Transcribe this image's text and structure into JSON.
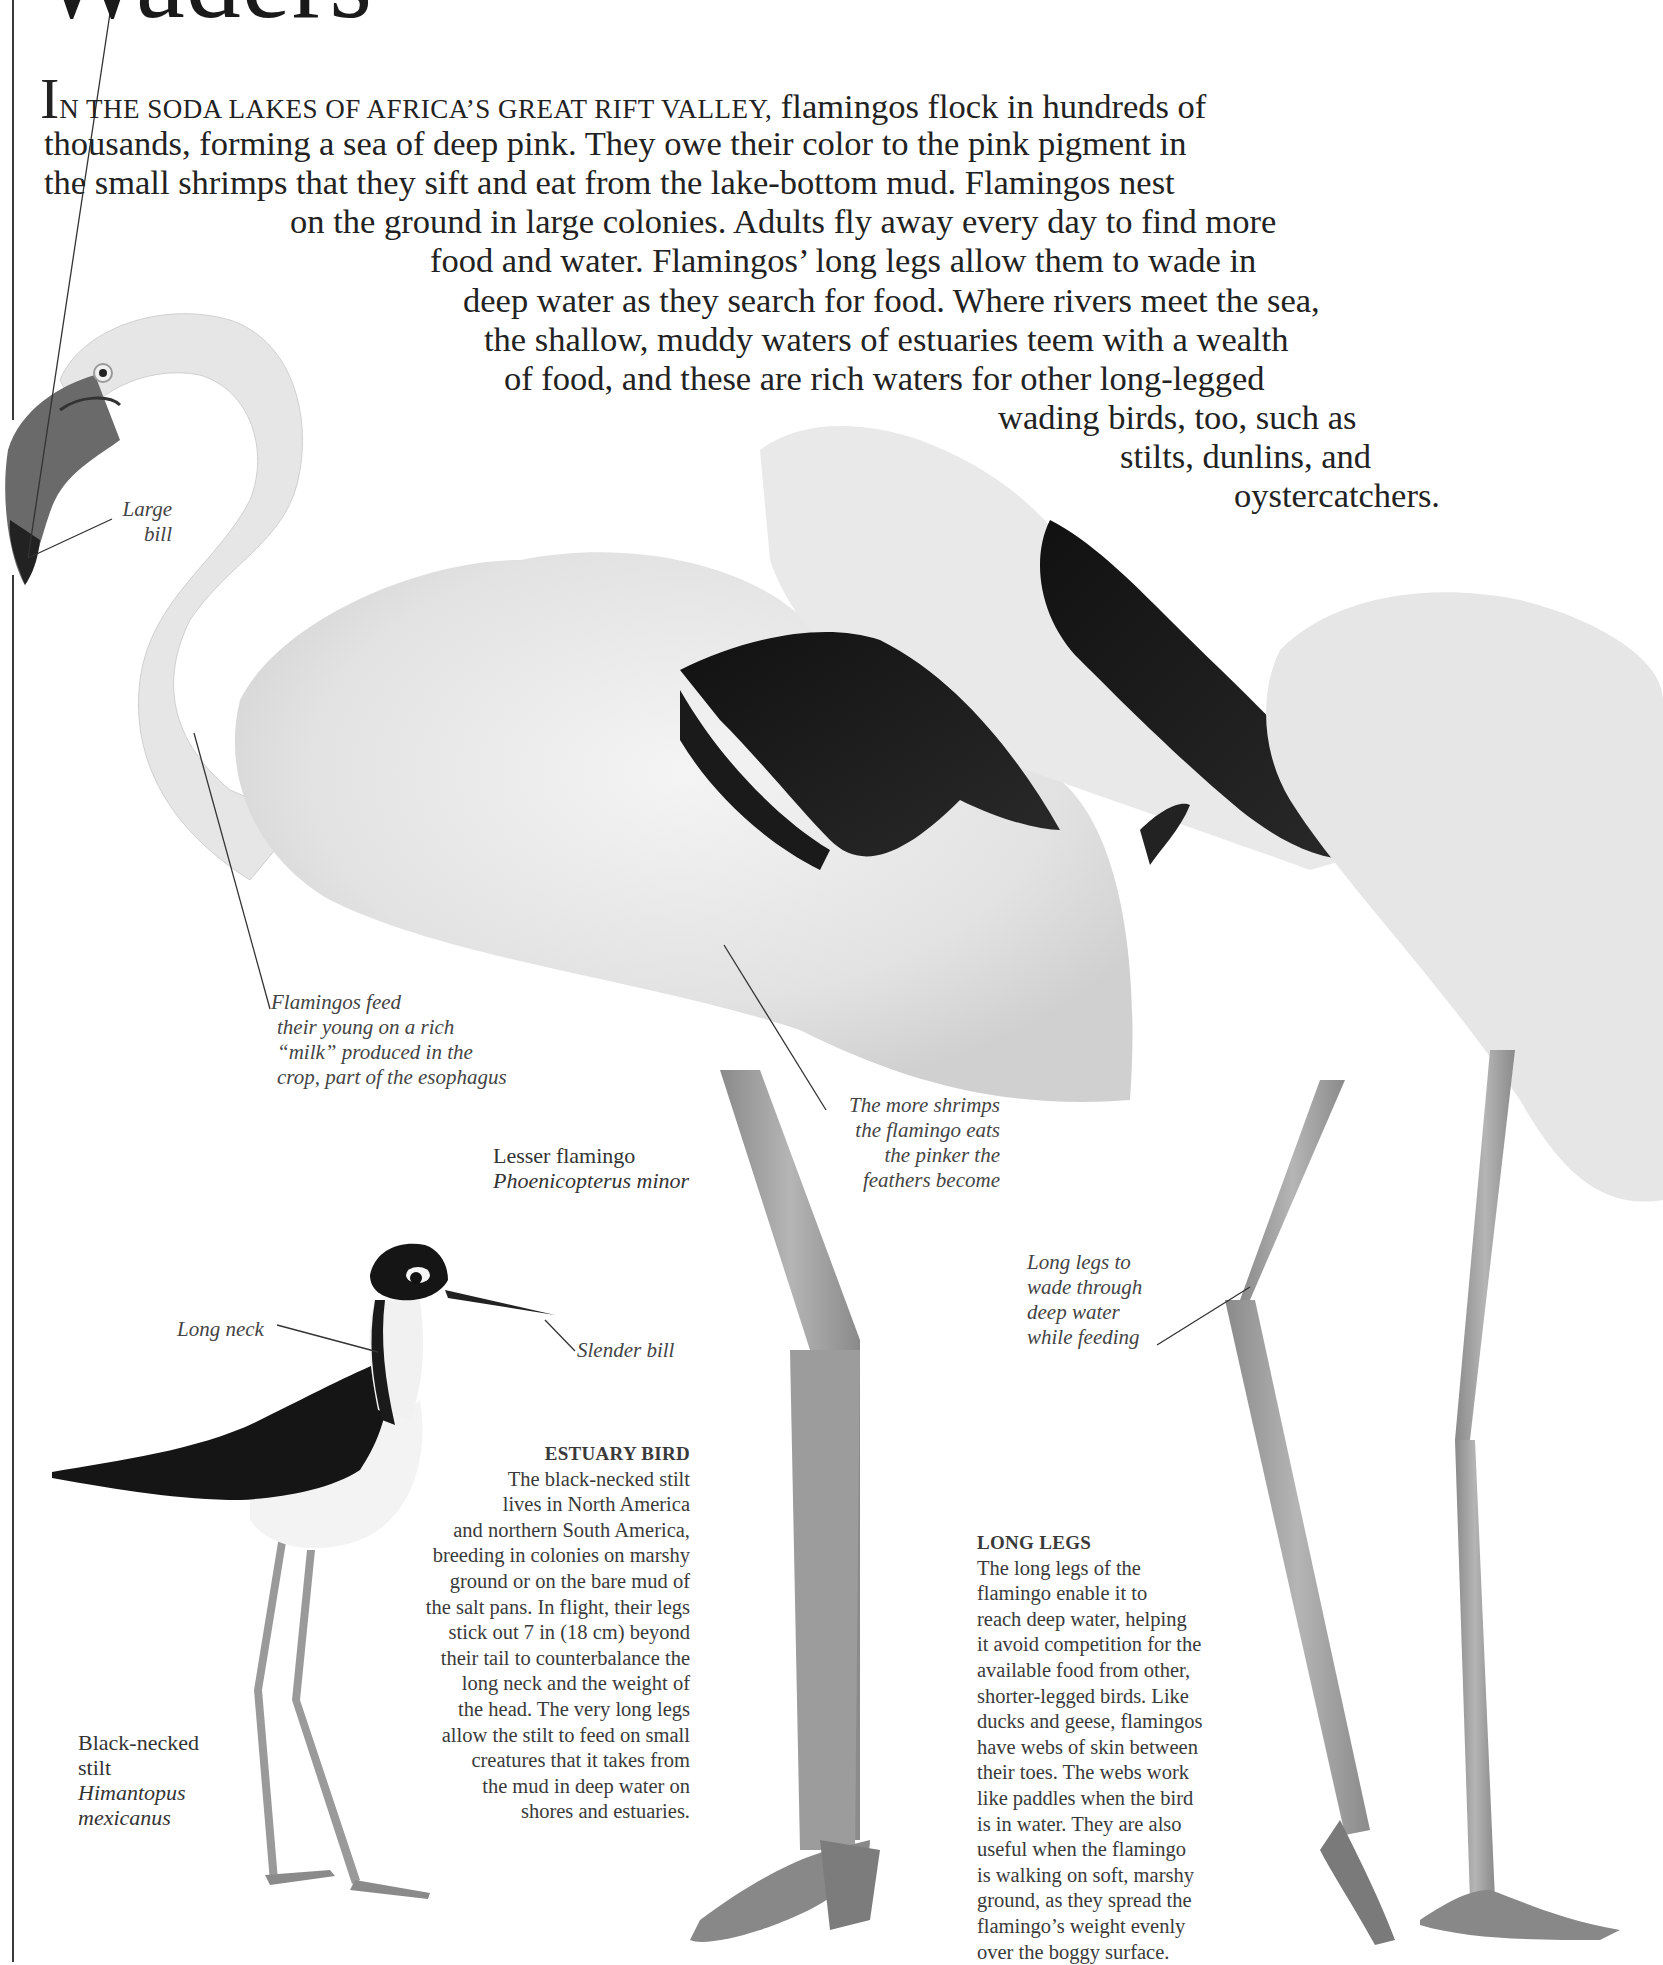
{
  "page": {
    "title": "Waders",
    "accent_color": "#3a3a3a"
  },
  "intro": {
    "dropcap": "I",
    "smallcaps": "N THE SODA LAKES OF AFRICA’S GREAT RIFT VALLEY,",
    "lines": [
      " flamingos flock in hundreds of",
      "thousands, forming a sea of deep pink. They owe their color to the pink pigment in",
      "the small shrimps that they sift and eat from the lake-bottom mud. Flamingos nest",
      "on the ground in large colonies. Adults fly away every day to find more",
      "food and water. Flamingos’ long legs allow them to wade in",
      "deep water as they search for food. Where rivers meet the sea,",
      "the shallow, muddy waters of estuaries teem with a wealth",
      "of food, and these are rich waters for other long-legged",
      "wading birds, too, such as",
      "stilts, dunlins, and",
      "oystercatchers."
    ]
  },
  "captions": {
    "large_bill": [
      "Large",
      "bill"
    ],
    "crop_milk": [
      "Flamingos feed",
      "their young on a rich",
      "“milk” produced in the",
      "crop, part of the esophagus"
    ],
    "shrimps": [
      "The more shrimps",
      "the flamingo eats",
      "the pinker the",
      "feathers become"
    ],
    "long_legs_wade": [
      "Long legs to",
      "wade through",
      "deep water",
      "while feeding"
    ],
    "long_neck": "Long neck",
    "slender_bill": "Slender bill"
  },
  "species_labels": {
    "flamingo": {
      "common": "Lesser flamingo",
      "scientific": "Phoenicopterus minor"
    },
    "stilt": {
      "common_lines": [
        "Black-necked",
        "stilt"
      ],
      "scientific_lines": [
        "Himantopus",
        "mexicanus"
      ]
    }
  },
  "estuary_bird": {
    "heading": "ESTUARY BIRD",
    "lines": [
      "The black-necked stilt",
      "lives in North America",
      "and northern South America,",
      "breeding in colonies on marshy",
      "ground or on the bare mud of",
      "the salt pans. In flight, their legs",
      "stick out 7 in (18 cm) beyond",
      "their tail to counterbalance the",
      "long neck and the weight of",
      "the head. The very long legs",
      "allow the stilt to feed on small",
      "creatures that it takes from",
      "the mud in deep water on",
      "shores and estuaries."
    ]
  },
  "long_legs": {
    "heading": "LONG LEGS",
    "lines": [
      "The long legs of the",
      "flamingo enable it to",
      "reach deep water, helping",
      "it avoid competition for the",
      "available food from other,",
      "shorter-legged birds. Like",
      "ducks and geese, flamingos",
      "have webs of skin between",
      "their toes. The webs work",
      "like paddles when the bird",
      "is in water. They are also",
      "useful when the flamingo",
      "is walking on soft, marshy",
      "ground, as they spread the",
      "flamingo’s weight evenly",
      "over the boggy surface."
    ]
  }
}
